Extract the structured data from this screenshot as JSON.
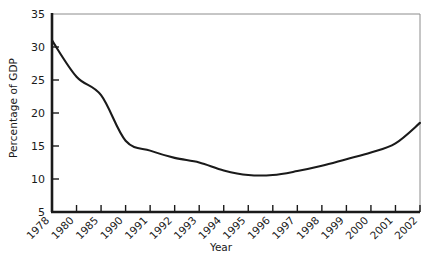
{
  "chart_data": {
    "type": "line",
    "title": "",
    "xlabel": "Year",
    "ylabel": "Percentage of GDP",
    "categories": [
      "1978",
      "1980",
      "1985",
      "1990",
      "1991",
      "1992",
      "1993",
      "1994",
      "1995",
      "1996",
      "1997",
      "1998",
      "1999",
      "2000",
      "2001",
      "2002"
    ],
    "values": [
      31.0,
      25.5,
      22.7,
      15.8,
      14.3,
      13.2,
      12.5,
      11.3,
      10.6,
      10.6,
      11.2,
      12.0,
      13.0,
      14.0,
      15.4,
      18.5
    ],
    "ylim": [
      5,
      35
    ],
    "yticks": [
      5,
      10,
      15,
      20,
      25,
      30,
      35
    ],
    "ytick_labels": [
      "5",
      "10",
      "15",
      "20",
      "25",
      "30",
      "35"
    ],
    "grid": false,
    "legend": "none",
    "line_color": "#1a1a1a",
    "axis_color": "#1a1a1a",
    "frame_color": "#8c8c8c",
    "background": "#ffffff"
  },
  "axes": {
    "y_title": "Percentage of GDP",
    "x_title": "Year"
  }
}
